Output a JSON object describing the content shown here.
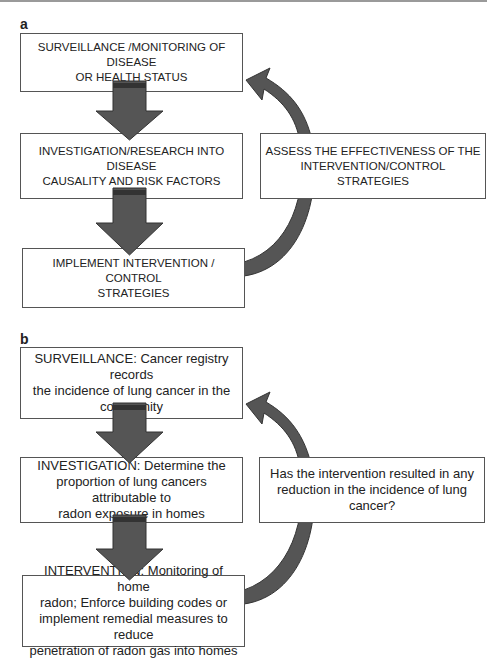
{
  "panels": [
    {
      "label": "a",
      "steps": [
        {
          "text": "SURVEILLANCE /MONITORING OF DISEASE\nOR HEALTH STATUS"
        },
        {
          "text": "INVESTIGATION/RESEARCH INTO DISEASE\nCAUSALITY AND RISK FACTORS"
        },
        {
          "text": "IMPLEMENT INTERVENTION / CONTROL\nSTRATEGIES"
        }
      ],
      "feedback": {
        "text": "ASSESS THE EFFECTIVENESS OF THE\nINTERVENTION/CONTROL STRATEGIES"
      }
    },
    {
      "label": "b",
      "steps": [
        {
          "text": "SURVEILLANCE: Cancer registry records\nthe incidence of lung cancer in the\ncommunity"
        },
        {
          "text": "INVESTIGATION: Determine the\nproportion of lung cancers attributable to\nradon exposure in homes"
        },
        {
          "text": "INTERVENTION: Monitoring of home\nradon; Enforce building codes or\nimplement remedial measures to reduce\npenetration of radon gas into homes"
        }
      ],
      "feedback": {
        "text": "Has the intervention resulted in any\nreduction in the incidence of lung cancer?"
      }
    }
  ],
  "colors": {
    "arrow_fill": "#555555",
    "arrow_band": "#333333",
    "border": "#555555"
  }
}
